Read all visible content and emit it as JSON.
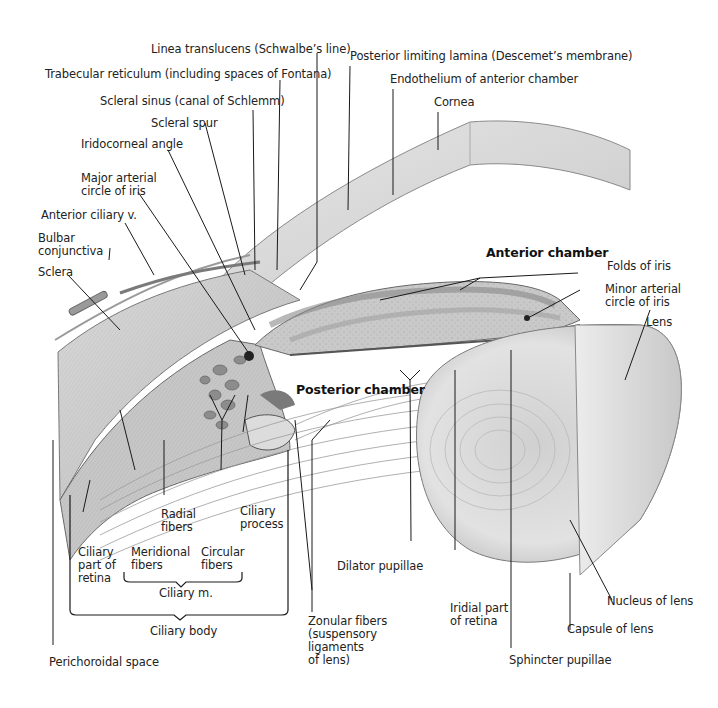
{
  "figure": {
    "labels": {
      "linea_translucens": "Linea translucens (Schwalbe’s line)",
      "posterior_limiting_lamina": "Posterior limiting lamina (Descemet’s membrane)",
      "trabecular_reticulum": "Trabecular reticulum (including spaces of Fontana)",
      "endothelium": "Endothelium of anterior chamber",
      "scleral_sinus": "Scleral sinus (canal of Schlemm)",
      "cornea": "Cornea",
      "scleral_spur": "Scleral spur",
      "iridocorneal_angle": "Iridocorneal angle",
      "major_arterial_1": "Major arterial",
      "major_arterial_2": "circle of iris",
      "anterior_ciliary_v": "Anterior ciliary v.",
      "bulbar_1": "Bulbar",
      "bulbar_2": "conjunctiva",
      "sclera": "Sclera",
      "anterior_chamber": "Anterior chamber",
      "folds_of_iris": "Folds of iris",
      "minor_arterial_1": "Minor arterial",
      "minor_arterial_2": "circle of iris",
      "lens": "Lens",
      "posterior_chamber": "Posterior chamber",
      "radial_1": "Radial",
      "radial_2": "fibers",
      "ciliary_process_1": "Ciliary",
      "ciliary_process_2": "process",
      "ciliary_part_1": "Ciliary",
      "ciliary_part_2": "part of",
      "ciliary_part_3": "retina",
      "meridional_1": "Meridional",
      "meridional_2": "fibers",
      "circular_1": "Circular",
      "circular_2": "fibers",
      "ciliary_m": "Ciliary m.",
      "ciliary_body": "Ciliary body",
      "dilator_pupillae": "Dilator pupillae",
      "zonular_1": "Zonular fibers",
      "zonular_2": "(suspensory",
      "zonular_3": "ligaments",
      "zonular_4": "of lens)",
      "iridial_1": "Iridial part",
      "iridial_2": "of retina",
      "nucleus_of_lens": "Nucleus of lens",
      "capsule_of_lens": "Capsule of lens",
      "sphincter_pupillae": "Sphincter pupillae",
      "perichoroidal_space": "Perichoroidal space"
    }
  }
}
